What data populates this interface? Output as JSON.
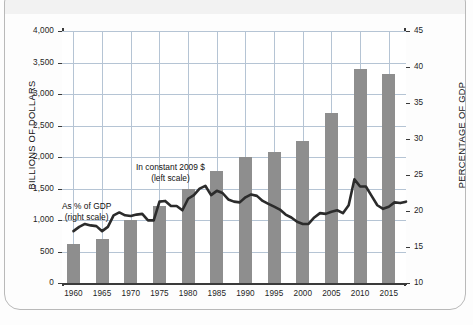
{
  "chart_data": {
    "type": "bar",
    "title": "",
    "subtitle": "",
    "xlabel": "",
    "ylabel": "BILLIONS OF DOLLARS",
    "y2label": "PERCENTAGE OF GDP",
    "grid": true,
    "legend_position": "inline-annotations",
    "categories": [
      "1960",
      "1965",
      "1970",
      "1975",
      "1980",
      "1985",
      "1990",
      "1995",
      "2000",
      "2005",
      "2010",
      "2015"
    ],
    "xlim": [
      1958,
      2018
    ],
    "ylim": [
      0,
      4000
    ],
    "y2lim": [
      10,
      45
    ],
    "ytick_labels": [
      "0",
      "500",
      "1,000",
      "1,500",
      "2,000",
      "2,500",
      "3,000",
      "3,500",
      "4,000"
    ],
    "ytick_values": [
      0,
      500,
      1000,
      1500,
      2000,
      2500,
      3000,
      3500,
      4000
    ],
    "y2tick_labels": [
      "10",
      "15",
      "20",
      "25",
      "30",
      "35",
      "40",
      "45"
    ],
    "y2tick_values": [
      10,
      15,
      20,
      25,
      30,
      35,
      40,
      45
    ],
    "xtick_labels": [
      "1960",
      "1965",
      "1970",
      "1975",
      "1980",
      "1985",
      "1990",
      "1995",
      "2000",
      "2005",
      "2010",
      "2015"
    ],
    "series": [
      {
        "name": "In constant 2009 $ (left scale)",
        "type": "bar",
        "axis": "left",
        "color": "#8e8e8e",
        "categories": [
          "1960",
          "1965",
          "1970",
          "1975",
          "1980",
          "1985",
          "1990",
          "1995",
          "2000",
          "2005",
          "2010",
          "2015"
        ],
        "values": [
          625,
          700,
          1000,
          1225,
          1500,
          1775,
          2000,
          2075,
          2250,
          2700,
          3400,
          3325
        ]
      },
      {
        "name": "As % of GDP (right scale)",
        "type": "line",
        "axis": "right",
        "color": "#2b2b2b",
        "x": [
          1960,
          1961,
          1962,
          1963,
          1964,
          1965,
          1966,
          1967,
          1968,
          1969,
          1970,
          1971,
          1972,
          1973,
          1974,
          1975,
          1976,
          1977,
          1978,
          1979,
          1980,
          1981,
          1982,
          1983,
          1984,
          1985,
          1986,
          1987,
          1988,
          1989,
          1990,
          1991,
          1992,
          1993,
          1994,
          1995,
          1996,
          1997,
          1998,
          1999,
          2000,
          2001,
          2002,
          2003,
          2004,
          2005,
          2006,
          2007,
          2008,
          2009,
          2010,
          2011,
          2012,
          2013,
          2014,
          2015,
          2016,
          2017,
          2018
        ],
        "values": [
          17.2,
          17.8,
          18.2,
          18.0,
          17.9,
          17.2,
          17.8,
          19.4,
          19.8,
          19.4,
          19.3,
          19.5,
          19.6,
          18.7,
          18.7,
          21.3,
          21.4,
          20.7,
          20.7,
          20.1,
          21.7,
          22.2,
          23.1,
          23.5,
          22.2,
          22.8,
          22.5,
          21.6,
          21.3,
          21.2,
          21.9,
          22.3,
          22.1,
          21.4,
          21.0,
          20.6,
          20.2,
          19.5,
          19.1,
          18.5,
          18.2,
          18.2,
          19.1,
          19.7,
          19.6,
          19.9,
          20.1,
          19.7,
          20.8,
          24.4,
          23.4,
          23.4,
          22.1,
          20.8,
          20.3,
          20.6,
          21.2,
          21.1,
          21.3
        ]
      }
    ],
    "annotations": [
      {
        "text_line1": "In constant 2009 $",
        "text_line2": "(left scale)"
      },
      {
        "text_line1": "As % of GDP",
        "text_line2": "(right scale)"
      }
    ],
    "colors": {
      "bar": "#8e8e8e",
      "line": "#2b2b2b",
      "grid": "#b5c4d4",
      "axis": "#3a3a3a",
      "frame": "#b9b9b9",
      "background": "#ffffff"
    }
  }
}
